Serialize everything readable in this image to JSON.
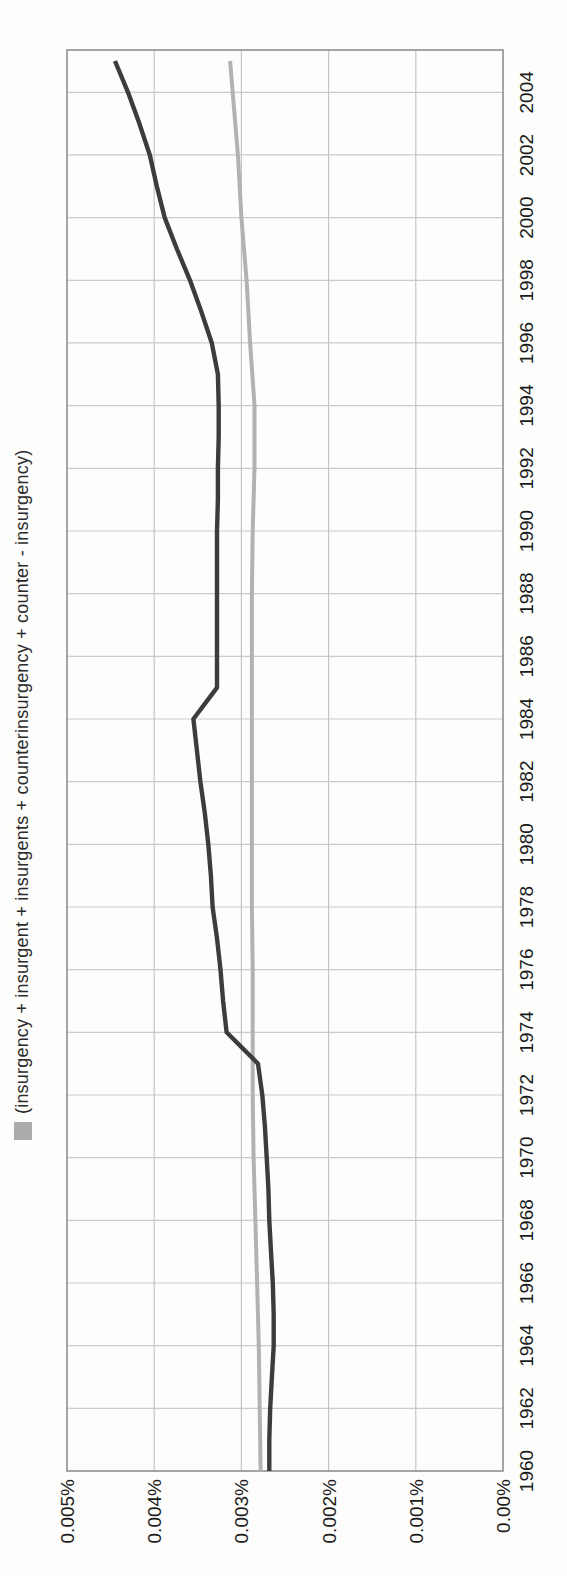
{
  "page": {
    "background": "#fdfdfc",
    "orientation_note": "line chart printed rotated 90 degrees counter-clockwise on the page"
  },
  "chart_data": {
    "type": "line",
    "title": "",
    "xlabel": "",
    "ylabel": "",
    "grid": true,
    "legend_position": "top-center",
    "legend": [
      {
        "label": "(insurgency + insurgent + insurgents + counterinsurgency + counter - insurgency)",
        "color": "#ababab"
      }
    ],
    "x_range": [
      1960,
      2005.35
    ],
    "y_range": [
      0,
      0.005
    ],
    "x_ticks": [
      1960,
      1962,
      1964,
      1966,
      1968,
      1970,
      1972,
      1974,
      1976,
      1978,
      1980,
      1982,
      1984,
      1986,
      1988,
      1990,
      1992,
      1994,
      1996,
      1998,
      2000,
      2002,
      2004
    ],
    "y_ticks": [
      {
        "label": "0.005%",
        "value": 0.005
      },
      {
        "label": "0.004%",
        "value": 0.004
      },
      {
        "label": "0.003%",
        "value": 0.003
      },
      {
        "label": "0.002%",
        "value": 0.002
      },
      {
        "label": "0.001%",
        "value": 0.001
      },
      {
        "label": "0.00%",
        "value": 0
      }
    ],
    "series": [
      {
        "name": "(insurgency + insurgent + insurgents + counterinsurgency + counter - insurgency)",
        "color": "#b2b2b2",
        "width": 4,
        "points": [
          [
            1960,
            0.00278
          ],
          [
            1962,
            0.00279
          ],
          [
            1964,
            0.0028
          ],
          [
            1966,
            0.00282
          ],
          [
            1968,
            0.00284
          ],
          [
            1970,
            0.00286
          ],
          [
            1972,
            0.00287
          ],
          [
            1974,
            0.00287
          ],
          [
            1976,
            0.00287
          ],
          [
            1978,
            0.00288
          ],
          [
            1980,
            0.00288
          ],
          [
            1982,
            0.00288
          ],
          [
            1984,
            0.00288
          ],
          [
            1986,
            0.00288
          ],
          [
            1988,
            0.00288
          ],
          [
            1990,
            0.00287
          ],
          [
            1992,
            0.00285
          ],
          [
            1994,
            0.00285
          ],
          [
            1996,
            0.0029
          ],
          [
            1998,
            0.00294
          ],
          [
            2000,
            0.003
          ],
          [
            2002,
            0.00304
          ],
          [
            2004,
            0.0031
          ],
          [
            2005,
            0.00313
          ]
        ]
      },
      {
        "name": "unlabeled-dark-series",
        "color": "#3c3c3c",
        "width": 4.4,
        "points": [
          [
            1960,
            0.00268
          ],
          [
            1961,
            0.00268
          ],
          [
            1962,
            0.00267
          ],
          [
            1963,
            0.00265
          ],
          [
            1964,
            0.00263
          ],
          [
            1965,
            0.00263
          ],
          [
            1966,
            0.00264
          ],
          [
            1967,
            0.00266
          ],
          [
            1968,
            0.00268
          ],
          [
            1969,
            0.00269
          ],
          [
            1970,
            0.00271
          ],
          [
            1971,
            0.00273
          ],
          [
            1972,
            0.00276
          ],
          [
            1973,
            0.00281
          ],
          [
            1974,
            0.00317
          ],
          [
            1975,
            0.00321
          ],
          [
            1976,
            0.00324
          ],
          [
            1977,
            0.00328
          ],
          [
            1978,
            0.00333
          ],
          [
            1979,
            0.00335
          ],
          [
            1980,
            0.00338
          ],
          [
            1981,
            0.00342
          ],
          [
            1982,
            0.00347
          ],
          [
            1983,
            0.00351
          ],
          [
            1984,
            0.00355
          ],
          [
            1985,
            0.00328
          ],
          [
            1986,
            0.00328
          ],
          [
            1987,
            0.00328
          ],
          [
            1988,
            0.00328
          ],
          [
            1989,
            0.00328
          ],
          [
            1990,
            0.00328
          ],
          [
            1991,
            0.00327
          ],
          [
            1992,
            0.00327
          ],
          [
            1993,
            0.00326
          ],
          [
            1994,
            0.00326
          ],
          [
            1995,
            0.00327
          ],
          [
            1996,
            0.00334
          ],
          [
            1997,
            0.00346
          ],
          [
            1998,
            0.00359
          ],
          [
            1999,
            0.00374
          ],
          [
            2000,
            0.00388
          ],
          [
            2001,
            0.00397
          ],
          [
            2002,
            0.00405
          ],
          [
            2003,
            0.00417
          ],
          [
            2004,
            0.0043
          ],
          [
            2005,
            0.00445
          ]
        ]
      }
    ],
    "colors": {
      "year_gridline": "#cbcbcb",
      "value_gridline": "#c5c5c5",
      "plot_border": "#8f8f8f",
      "tick_text": "#1b1b1b",
      "legend_text": "#2b2b2b"
    }
  }
}
